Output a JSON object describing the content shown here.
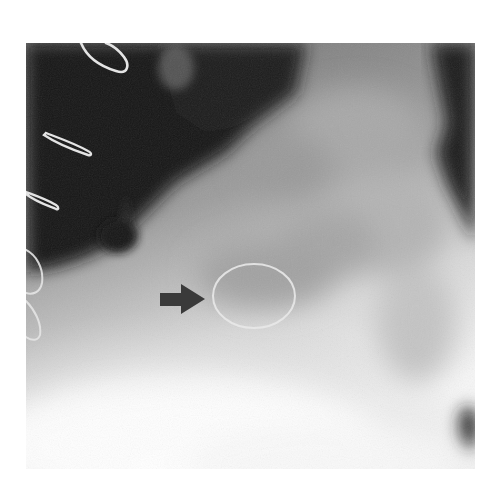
{
  "figure": {
    "kind": "radiograph",
    "modality": "x-ray",
    "annotation": {
      "type": "arrow",
      "direction": "right",
      "color": "#3a3a3a",
      "target": "oval-ring"
    },
    "marker": {
      "shape": "ellipse",
      "color": "#e6e6e6"
    },
    "colors": {
      "background": "#ffffff",
      "dark_region": "#111111",
      "mid_tone": "#8c8c8c",
      "light_region": "#f2f2f2",
      "arrow": "#3a3a3a",
      "wire": "#e0e0e0"
    }
  }
}
